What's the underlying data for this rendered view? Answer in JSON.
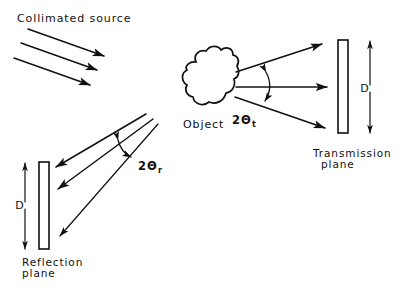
{
  "figure": {
    "type": "optics-scattering-diagram",
    "background_color": "#ffffff",
    "ink_color": "#111111",
    "width": 412,
    "height": 291
  },
  "labels": {
    "collimated_source": "Collimated source",
    "object": "Object",
    "transmission_angle_main": "2Θ",
    "transmission_angle_sub": "t",
    "reflection_angle_main": "2Θ",
    "reflection_angle_sub": "r",
    "transmission_plane_line1": "Transmission",
    "transmission_plane_line2": "plane",
    "reflection_plane_line1": "Reflection",
    "reflection_plane_line2": "plane",
    "transmission_extent": "D",
    "reflection_extent": "D"
  },
  "elements": {
    "collimated_source_beams": 3,
    "transmission_rays": 3,
    "reflection_rays": 3,
    "transmission_plane_shape": "thin-vertical-rectangle",
    "reflection_plane_shape": "thin-vertical-rectangle",
    "object_shape": "irregular-blob"
  }
}
